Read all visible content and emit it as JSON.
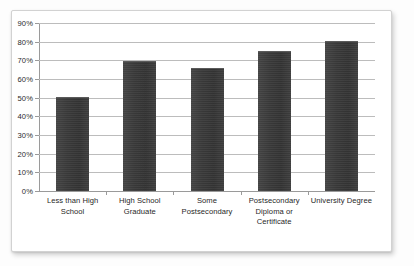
{
  "chart_data": {
    "type": "bar",
    "title": "",
    "subtitle": "",
    "xlabel": "",
    "ylabel": "",
    "categories": [
      "Less than High School",
      "High School Graduate",
      "Some Postsecondary",
      "Postsecondary Diploma or Certificate",
      "University Degree"
    ],
    "values": [
      50,
      69,
      65.5,
      74.5,
      80
    ],
    "value_labels": [
      "50%",
      "69%",
      "66%",
      "75%",
      "80%"
    ],
    "ylim": [
      0,
      90
    ],
    "ytick_values": [
      0,
      10,
      20,
      30,
      40,
      50,
      60,
      70,
      80,
      90
    ],
    "ytick_labels": [
      "0%",
      "10%",
      "20%",
      "30%",
      "40%",
      "50%",
      "60%",
      "70%",
      "80%",
      "90%"
    ],
    "grid": "horizontal",
    "legend": "none",
    "bar_color": "#3a3a3a",
    "gridline_color": "#bcbcbc",
    "axis_color": "#9a9a9a",
    "background_color": "#ffffff"
  }
}
